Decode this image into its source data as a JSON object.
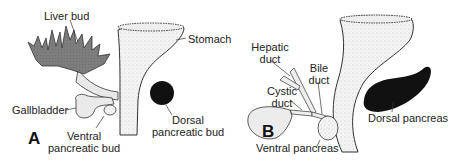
{
  "panels": [
    {
      "letter": "A",
      "labels": {
        "liver_bud": "Liver bud",
        "stomach": "Stomach",
        "gallbladder": "Gallbladder",
        "dorsal_1": "Dorsal",
        "dorsal_2": "pancreatic bud",
        "ventral_1": "Ventral",
        "ventral_2": "pancreatic bud"
      }
    },
    {
      "letter": "B",
      "labels": {
        "hepatic_1": "Hepatic",
        "hepatic_2": "duct",
        "bile_1": "Bile",
        "bile_2": "duct",
        "cystic_1": "Cystic",
        "cystic_2": "duct",
        "dorsal_pancreas": "Dorsal pancreas",
        "ventral_pancreas": "Ventral pancreas"
      }
    }
  ],
  "colors": {
    "liver": "#7a7a7a",
    "pancreas_dark": "#111111",
    "tube_fill": "#f2f2f2",
    "outline": "#333333"
  }
}
